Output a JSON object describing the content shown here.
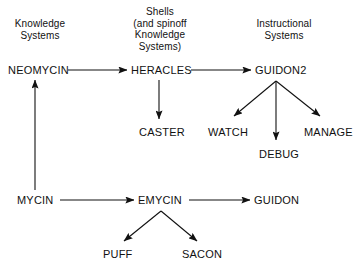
{
  "diagram": {
    "background_color": "#ffffff",
    "ink_color": "#111111",
    "group_headings": [
      {
        "id": "knowledge-systems",
        "text": "Knowledge\nSystems",
        "x": 8,
        "y": 18,
        "width": 64
      },
      {
        "id": "shells-and-spinoff",
        "text": "Shells\n(and spinoff\nKnowledge\nSystems)",
        "x": 124,
        "y": 6,
        "width": 72
      },
      {
        "id": "instructional-systems",
        "text": "Instructional\nSystems",
        "x": 248,
        "y": 18,
        "width": 72
      }
    ],
    "nodes": [
      {
        "id": "neomycin",
        "label": "NEOMYCIN",
        "x": 8,
        "y": 64
      },
      {
        "id": "heracles",
        "label": "HERACLES",
        "x": 131,
        "y": 64
      },
      {
        "id": "guidon2",
        "label": "GUIDON2",
        "x": 255,
        "y": 64
      },
      {
        "id": "caster",
        "label": "CASTER",
        "x": 139,
        "y": 126
      },
      {
        "id": "watch",
        "label": "WATCH",
        "x": 208,
        "y": 126
      },
      {
        "id": "manage",
        "label": "MANAGE",
        "x": 304,
        "y": 126
      },
      {
        "id": "debug",
        "label": "DEBUG",
        "x": 259,
        "y": 148
      },
      {
        "id": "mycin",
        "label": "MYCIN",
        "x": 17,
        "y": 194
      },
      {
        "id": "emycin",
        "label": "EMYCIN",
        "x": 138,
        "y": 194
      },
      {
        "id": "guidon",
        "label": "GUIDON",
        "x": 254,
        "y": 194
      },
      {
        "id": "puff",
        "label": "PUFF",
        "x": 103,
        "y": 248
      },
      {
        "id": "sacon",
        "label": "SACON",
        "x": 182,
        "y": 248
      }
    ],
    "edges": [
      {
        "id": "mycin-to-neomycin",
        "from": "mycin",
        "to": "neomycin",
        "x1": 35,
        "y1": 190,
        "x2": 35,
        "y2": 80
      },
      {
        "id": "neomycin-to-heracles",
        "from": "neomycin",
        "to": "heracles",
        "x1": 68,
        "y1": 70,
        "x2": 127,
        "y2": 70
      },
      {
        "id": "heracles-to-guidon2",
        "from": "heracles",
        "to": "guidon2",
        "x1": 191,
        "y1": 70,
        "x2": 251,
        "y2": 70
      },
      {
        "id": "heracles-to-caster",
        "from": "heracles",
        "to": "caster",
        "x1": 159,
        "y1": 80,
        "x2": 159,
        "y2": 119
      },
      {
        "id": "guidon2-to-watch",
        "from": "guidon2",
        "to": "watch",
        "x1": 276,
        "y1": 81,
        "x2": 234,
        "y2": 116
      },
      {
        "id": "guidon2-to-debug",
        "from": "guidon2",
        "to": "debug",
        "x1": 276,
        "y1": 81,
        "x2": 276,
        "y2": 140
      },
      {
        "id": "guidon2-to-manage",
        "from": "guidon2",
        "to": "manage",
        "x1": 276,
        "y1": 81,
        "x2": 320,
        "y2": 116
      },
      {
        "id": "mycin-to-emycin",
        "from": "mycin",
        "to": "emycin",
        "x1": 60,
        "y1": 200,
        "x2": 134,
        "y2": 200
      },
      {
        "id": "emycin-to-guidon",
        "from": "emycin",
        "to": "guidon",
        "x1": 189,
        "y1": 200,
        "x2": 250,
        "y2": 200
      },
      {
        "id": "emycin-to-puff",
        "from": "emycin",
        "to": "puff",
        "x1": 161,
        "y1": 211,
        "x2": 124,
        "y2": 241
      },
      {
        "id": "emycin-to-sacon",
        "from": "emycin",
        "to": "sacon",
        "x1": 161,
        "y1": 211,
        "x2": 197,
        "y2": 241
      }
    ]
  }
}
